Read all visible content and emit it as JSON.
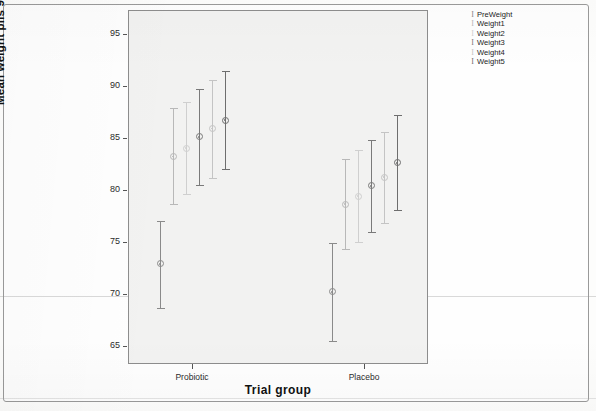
{
  "chart_data": {
    "type": "scatter",
    "title": "",
    "xlabel": "Trial group",
    "ylabel": "Mean weight plis 95% CI",
    "categories": [
      "Probiotic",
      "Placebo"
    ],
    "ylim": [
      63.5,
      96.5
    ],
    "yticks": [
      65,
      70,
      75,
      80,
      85,
      90,
      95
    ],
    "ytick_labels": [
      "65",
      "70",
      "75",
      "80",
      "85",
      "90",
      "95"
    ],
    "grid": false,
    "legend_position": "right-outside",
    "error_bar_type": "95% CI",
    "series": [
      {
        "name": "PreWeight",
        "color": "#8a8a8a",
        "points": [
          {
            "group": "Probiotic",
            "mean": 72.9,
            "ci_low": 68.7,
            "ci_high": 77.0
          },
          {
            "group": "Placebo",
            "mean": 70.2,
            "ci_low": 65.5,
            "ci_high": 74.9
          }
        ]
      },
      {
        "name": "Weight1",
        "color": "#b8b8b8",
        "points": [
          {
            "group": "Probiotic",
            "mean": 83.2,
            "ci_low": 78.7,
            "ci_high": 87.9
          },
          {
            "group": "Placebo",
            "mean": 78.6,
            "ci_low": 74.3,
            "ci_high": 83.0
          }
        ]
      },
      {
        "name": "Weight2",
        "color": "#cfcfcf",
        "points": [
          {
            "group": "Probiotic",
            "mean": 84.0,
            "ci_low": 79.6,
            "ci_high": 88.5
          },
          {
            "group": "Placebo",
            "mean": 79.4,
            "ci_low": 75.0,
            "ci_high": 83.8
          }
        ]
      },
      {
        "name": "Weight3",
        "color": "#7a7a7a",
        "points": [
          {
            "group": "Probiotic",
            "mean": 85.1,
            "ci_low": 80.5,
            "ci_high": 89.7
          },
          {
            "group": "Placebo",
            "mean": 80.4,
            "ci_low": 76.0,
            "ci_high": 84.8
          }
        ]
      },
      {
        "name": "Weight4",
        "color": "#c4c4c4",
        "points": [
          {
            "group": "Probiotic",
            "mean": 85.9,
            "ci_low": 81.2,
            "ci_high": 90.6
          },
          {
            "group": "Placebo",
            "mean": 81.2,
            "ci_low": 76.8,
            "ci_high": 85.6
          }
        ]
      },
      {
        "name": "Weight5",
        "color": "#6e6e6e",
        "points": [
          {
            "group": "Probiotic",
            "mean": 86.7,
            "ci_low": 82.0,
            "ci_high": 91.4
          },
          {
            "group": "Placebo",
            "mean": 82.6,
            "ci_low": 78.1,
            "ci_high": 87.2
          }
        ]
      }
    ]
  },
  "axes": {
    "y_title": "Mean weight plis 95% CI",
    "x_title": "Trial group",
    "y_ticks": [
      "95",
      "90",
      "85",
      "80",
      "75",
      "70",
      "65"
    ],
    "x_ticks": [
      "Probiotic",
      "Placebo"
    ]
  },
  "legend": {
    "entries": [
      {
        "key": "I",
        "label": "PreWeight"
      },
      {
        "key": "I",
        "label": "Weight1"
      },
      {
        "key": "I",
        "label": "Weight2"
      },
      {
        "key": "I",
        "label": "Weight3"
      },
      {
        "key": "I",
        "label": "Weight4"
      },
      {
        "key": "I",
        "label": "Weight5"
      }
    ]
  },
  "colors": {
    "panel_background": "#f2f2f1",
    "panel_border": "#8d8d8d",
    "page_background": "#fefefe",
    "text": "#1c1c1c"
  }
}
